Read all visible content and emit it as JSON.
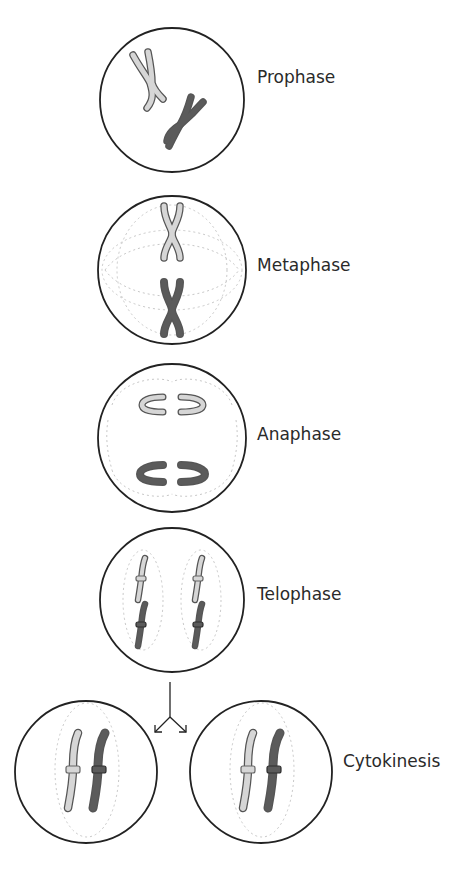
{
  "diagram": {
    "stages": [
      {
        "id": "prophase",
        "label": "Prophase"
      },
      {
        "id": "metaphase",
        "label": "Metaphase"
      },
      {
        "id": "anaphase",
        "label": "Anaphase"
      },
      {
        "id": "telophase",
        "label": "Telophase"
      },
      {
        "id": "cytokinesis",
        "label": "Cytokinesis"
      }
    ],
    "colors": {
      "cell_outline": "#222222",
      "chromosome_light": "#d6d6d6",
      "chromosome_dark": "#5b5b5b",
      "spindle": "#c8c8c8",
      "label": "#2a2a2a",
      "background": "#ffffff"
    },
    "arrow": {
      "type": "split-arrow",
      "branches": 2
    }
  }
}
